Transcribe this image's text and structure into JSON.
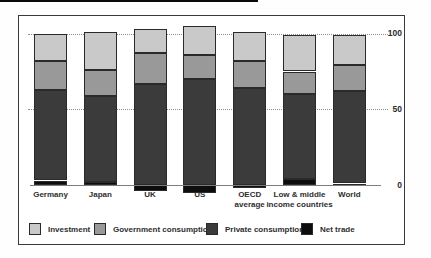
{
  "chart_data": {
    "type": "bar",
    "stacked": true,
    "title": "",
    "xlabel": "",
    "ylabel": "",
    "yticks": [
      0,
      50,
      100
    ],
    "ylim": [
      -7,
      106
    ],
    "grid": "horizontal dotted at 50 and 100",
    "legend_position": "bottom",
    "axis_side": "right",
    "categories": [
      "Germany",
      "Japan",
      "UK",
      "US",
      "OECD average",
      "Low & middle income countries",
      "World"
    ],
    "category_label_lines": [
      [
        "Germany"
      ],
      [
        "Japan"
      ],
      [
        "UK"
      ],
      [
        "US"
      ],
      [
        "OECD",
        "average"
      ],
      [
        "Low & middle",
        "income countries"
      ],
      [
        "World"
      ]
    ],
    "stack_order_bottom_to_top": [
      "Net trade",
      "Private consumption",
      "Government consumption",
      "Investment"
    ],
    "series": [
      {
        "name": "Investment",
        "color": "#c9c9c9",
        "values": [
          18,
          25,
          16,
          19,
          19,
          24,
          20
        ]
      },
      {
        "name": "Government consumption",
        "color": "#999999",
        "values": [
          19,
          17,
          20,
          16,
          18,
          15,
          17
        ]
      },
      {
        "name": "Private consumption",
        "color": "#3b3b3b",
        "values": [
          60,
          57,
          67,
          70,
          64,
          56,
          61
        ]
      },
      {
        "name": "Net trade",
        "color": "#0d0d0d",
        "values": [
          3,
          2,
          -4,
          -5,
          -2,
          4,
          1
        ]
      }
    ]
  },
  "colors": {
    "frame_border": "#3a3a3a",
    "axis_line": "#7d7d7d",
    "gridline": "#8f8f8f",
    "text": "#2e2e2e",
    "top_rule": "#0a0a0a"
  }
}
